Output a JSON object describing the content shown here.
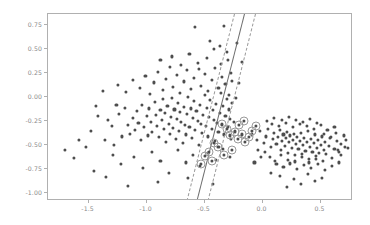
{
  "figure": {
    "background_color": "#ffffff",
    "axes_color": "#b0b0b0",
    "tick_label_color": "#8a8a8a"
  },
  "chart_data": {
    "type": "scatter",
    "title": "",
    "xlabel": "",
    "ylabel": "",
    "xlim": [
      -1.85,
      0.78
    ],
    "ylim": [
      -1.08,
      0.86
    ],
    "grid": false,
    "legend": null,
    "xticks": [
      -1.5,
      -1.0,
      -0.5,
      0.0,
      0.5
    ],
    "xticklabels": [
      "-1.5",
      "-1.0",
      "-0.5",
      "0.0",
      "0.5"
    ],
    "yticks": [
      0.75,
      0.5,
      0.25,
      0.0,
      -0.25,
      -0.5,
      -0.75,
      -1.0
    ],
    "yticklabels": [
      "0.75",
      "0.50",
      "0.25",
      "0.00",
      "-0.25",
      "-0.50",
      "-0.75",
      "-1.00"
    ],
    "point_color": "#4d4d4d",
    "point_size": 3.1,
    "support_vector_ring_color": "#9a9a9a",
    "decision_boundary": {
      "style": "solid",
      "color": "#6e6e6e",
      "x_at_ytop": -0.155,
      "x_at_ybottom": -0.565
    },
    "margins": [
      {
        "style": "dashed",
        "color": "#9a9a9a",
        "x_at_ytop": -0.235,
        "x_at_ybottom": -0.645
      },
      {
        "style": "dashed",
        "color": "#9a9a9a",
        "x_at_ytop": -0.055,
        "x_at_ybottom": -0.465
      }
    ],
    "series": [
      {
        "name": "class-0",
        "points": [
          [
            -1.38,
            0.06
          ],
          [
            -1.28,
            -0.5
          ],
          [
            -1.29,
            -0.6
          ],
          [
            -1.63,
            -0.63
          ],
          [
            -1.21,
            -0.41
          ],
          [
            -1.33,
            -0.24
          ],
          [
            -1.3,
            -0.3
          ],
          [
            -1.24,
            -0.18
          ],
          [
            -1.19,
            -0.11
          ],
          [
            -1.16,
            -0.29
          ],
          [
            -1.14,
            -0.38
          ],
          [
            -1.12,
            -0.22
          ],
          [
            -1.1,
            -0.34
          ],
          [
            -1.08,
            -0.15
          ],
          [
            -1.07,
            -0.27
          ],
          [
            -1.05,
            -0.45
          ],
          [
            -1.04,
            -0.08
          ],
          [
            -1.02,
            -0.31
          ],
          [
            -1.0,
            -0.2
          ],
          [
            -0.99,
            -0.4
          ],
          [
            -0.98,
            -0.12
          ],
          [
            -0.96,
            -0.26
          ],
          [
            -0.95,
            -0.36
          ],
          [
            -0.93,
            -0.05
          ],
          [
            -0.92,
            -0.19
          ],
          [
            -0.91,
            -0.3
          ],
          [
            -0.89,
            -0.42
          ],
          [
            -0.88,
            -0.14
          ],
          [
            -0.87,
            -0.24
          ],
          [
            -0.86,
            -0.02
          ],
          [
            -0.85,
            -0.33
          ],
          [
            -0.84,
            -0.17
          ],
          [
            -0.83,
            -0.47
          ],
          [
            -0.82,
            -0.09
          ],
          [
            -0.81,
            -0.28
          ],
          [
            -0.8,
            -0.38
          ],
          [
            -0.79,
            -0.21
          ],
          [
            -0.78,
            -0.01
          ],
          [
            -0.77,
            -0.32
          ],
          [
            -0.76,
            -0.13
          ],
          [
            -0.75,
            -0.44
          ],
          [
            -0.74,
            -0.23
          ],
          [
            -0.73,
            -0.06
          ],
          [
            -0.72,
            -0.35
          ],
          [
            -0.71,
            -0.16
          ],
          [
            -0.7,
            -0.26
          ],
          [
            -0.69,
            -0.48
          ],
          [
            -0.68,
            -0.1
          ],
          [
            -0.67,
            -0.29
          ],
          [
            -0.66,
            -0.39
          ],
          [
            -0.65,
            -0.18
          ],
          [
            -0.64,
            0.0
          ],
          [
            -0.63,
            -0.31
          ],
          [
            -0.62,
            -0.12
          ],
          [
            -0.61,
            -0.43
          ],
          [
            -0.6,
            -0.22
          ],
          [
            -0.59,
            -0.04
          ],
          [
            -0.58,
            -0.34
          ],
          [
            -0.57,
            -0.15
          ],
          [
            -0.56,
            -0.25
          ],
          [
            -0.55,
            -0.5
          ],
          [
            -0.54,
            -0.08
          ],
          [
            -0.53,
            -0.28
          ],
          [
            -0.52,
            -0.37
          ],
          [
            -0.51,
            -0.19
          ],
          [
            -0.5,
            0.02
          ],
          [
            -0.49,
            -0.3
          ],
          [
            -0.48,
            -0.11
          ],
          [
            -0.47,
            -0.41
          ],
          [
            -0.46,
            -0.21
          ],
          [
            -0.45,
            -0.03
          ],
          [
            -0.44,
            -0.33
          ],
          [
            -0.43,
            -0.14
          ],
          [
            -0.42,
            -0.24
          ],
          [
            -0.41,
            -0.46
          ],
          [
            -0.4,
            -0.07
          ],
          [
            -0.39,
            -0.27
          ],
          [
            -0.38,
            -0.36
          ],
          [
            -0.37,
            -0.17
          ],
          [
            -0.36,
            0.04
          ],
          [
            -0.35,
            -0.29
          ],
          [
            -0.34,
            -0.09
          ],
          [
            -0.33,
            -0.39
          ],
          [
            -0.32,
            -0.2
          ],
          [
            -0.31,
            -0.02
          ],
          [
            -0.3,
            -0.31
          ],
          [
            -0.29,
            -0.13
          ],
          [
            -0.28,
            -0.23
          ],
          [
            -0.27,
            -0.44
          ],
          [
            -0.26,
            -0.06
          ],
          [
            -0.25,
            -0.26
          ],
          [
            -0.24,
            -0.35
          ],
          [
            -1.25,
            0.12
          ],
          [
            -1.18,
            0.05
          ],
          [
            -1.12,
            0.18
          ],
          [
            -1.06,
            0.09
          ],
          [
            -1.01,
            0.22
          ],
          [
            -0.97,
            0.03
          ],
          [
            -0.94,
            0.15
          ],
          [
            -0.9,
            0.26
          ],
          [
            -0.86,
            0.07
          ],
          [
            -0.83,
            0.19
          ],
          [
            -0.8,
            0.31
          ],
          [
            -0.77,
            0.1
          ],
          [
            -0.74,
            0.23
          ],
          [
            -0.71,
            0.04
          ],
          [
            -0.68,
            0.16
          ],
          [
            -0.65,
            0.28
          ],
          [
            -0.62,
            0.08
          ],
          [
            -0.59,
            0.2
          ],
          [
            -0.56,
            0.35
          ],
          [
            -0.53,
            0.11
          ],
          [
            -0.5,
            0.24
          ],
          [
            -0.47,
            0.06
          ],
          [
            -0.44,
            0.18
          ],
          [
            -0.41,
            0.3
          ],
          [
            -0.38,
            0.09
          ],
          [
            -0.35,
            0.21
          ],
          [
            -0.32,
            0.13
          ],
          [
            -0.29,
            0.02
          ],
          [
            -0.88,
            0.38
          ],
          [
            -0.78,
            0.42
          ],
          [
            -0.7,
            0.33
          ],
          [
            -0.63,
            0.45
          ],
          [
            -0.55,
            0.29
          ],
          [
            -0.48,
            0.4
          ],
          [
            -0.42,
            0.5
          ],
          [
            -0.36,
            0.34
          ],
          [
            -0.31,
            0.47
          ],
          [
            -0.27,
            0.25
          ],
          [
            -0.58,
            0.73
          ],
          [
            -0.33,
            0.74
          ],
          [
            -0.45,
            0.58
          ],
          [
            -0.22,
            0.56
          ],
          [
            -0.18,
            0.36
          ],
          [
            -0.2,
            0.14
          ],
          [
            -0.23,
            -0.01
          ],
          [
            -0.26,
            0.17
          ],
          [
            -0.3,
            0.38
          ],
          [
            -0.37,
            0.53
          ],
          [
            -1.45,
            -0.77
          ],
          [
            -1.35,
            -0.83
          ],
          [
            -1.22,
            -0.7
          ],
          [
            -1.11,
            -0.62
          ],
          [
            -1.03,
            -0.74
          ],
          [
            -0.95,
            -0.57
          ],
          [
            -0.88,
            -0.66
          ],
          [
            -0.81,
            -0.79
          ],
          [
            -0.73,
            -0.55
          ],
          [
            -0.66,
            -0.68
          ],
          [
            -0.6,
            -0.6
          ],
          [
            -0.54,
            -0.72
          ],
          [
            -0.47,
            -0.58
          ],
          [
            -0.4,
            -0.65
          ],
          [
            -0.34,
            -0.54
          ],
          [
            -0.28,
            -0.62
          ],
          [
            -1.16,
            -0.92
          ],
          [
            -0.9,
            -0.88
          ],
          [
            -0.64,
            -0.84
          ],
          [
            -0.43,
            -0.9
          ],
          [
            -1.48,
            -0.35
          ],
          [
            -1.52,
            -0.52
          ],
          [
            -1.42,
            -0.2
          ],
          [
            -1.58,
            -0.45
          ],
          [
            -1.7,
            -0.55
          ],
          [
            -1.44,
            -0.09
          ],
          [
            -1.36,
            -0.45
          ],
          [
            -1.26,
            -0.08
          ]
        ]
      },
      {
        "name": "class-1",
        "points": [
          [
            -0.09,
            -0.39
          ],
          [
            -0.05,
            -0.45
          ],
          [
            -0.02,
            -0.35
          ],
          [
            0.01,
            -0.48
          ],
          [
            0.03,
            -0.41
          ],
          [
            0.05,
            -0.33
          ],
          [
            0.07,
            -0.52
          ],
          [
            0.09,
            -0.44
          ],
          [
            0.1,
            -0.37
          ],
          [
            0.12,
            -0.49
          ],
          [
            0.13,
            -0.42
          ],
          [
            0.15,
            -0.34
          ],
          [
            0.16,
            -0.55
          ],
          [
            0.17,
            -0.46
          ],
          [
            0.18,
            -0.39
          ],
          [
            0.19,
            -0.51
          ],
          [
            0.2,
            -0.43
          ],
          [
            0.21,
            -0.36
          ],
          [
            0.22,
            -0.58
          ],
          [
            0.23,
            -0.47
          ],
          [
            0.24,
            -0.4
          ],
          [
            0.25,
            -0.53
          ],
          [
            0.26,
            -0.45
          ],
          [
            0.27,
            -0.38
          ],
          [
            0.28,
            -0.6
          ],
          [
            0.29,
            -0.49
          ],
          [
            0.3,
            -0.42
          ],
          [
            0.31,
            -0.54
          ],
          [
            0.32,
            -0.46
          ],
          [
            0.33,
            -0.37
          ],
          [
            0.34,
            -0.62
          ],
          [
            0.35,
            -0.5
          ],
          [
            0.36,
            -0.43
          ],
          [
            0.37,
            -0.56
          ],
          [
            0.38,
            -0.47
          ],
          [
            0.39,
            -0.35
          ],
          [
            0.4,
            -0.64
          ],
          [
            0.41,
            -0.52
          ],
          [
            0.42,
            -0.44
          ],
          [
            0.43,
            -0.57
          ],
          [
            0.44,
            -0.48
          ],
          [
            0.45,
            -0.39
          ],
          [
            0.46,
            -0.61
          ],
          [
            0.47,
            -0.53
          ],
          [
            0.48,
            -0.45
          ],
          [
            0.49,
            -0.58
          ],
          [
            0.5,
            -0.5
          ],
          [
            0.51,
            -0.41
          ],
          [
            0.52,
            -0.66
          ],
          [
            0.53,
            -0.55
          ],
          [
            0.54,
            -0.47
          ],
          [
            0.55,
            -0.59
          ],
          [
            0.57,
            -0.51
          ],
          [
            0.58,
            -0.43
          ],
          [
            0.6,
            -0.63
          ],
          [
            0.62,
            -0.54
          ],
          [
            0.64,
            -0.46
          ],
          [
            0.66,
            -0.57
          ],
          [
            0.68,
            -0.49
          ],
          [
            0.7,
            -0.4
          ],
          [
            0.08,
            -0.28
          ],
          [
            0.14,
            -0.3
          ],
          [
            0.2,
            -0.27
          ],
          [
            0.26,
            -0.31
          ],
          [
            0.32,
            -0.28
          ],
          [
            0.38,
            -0.3
          ],
          [
            0.44,
            -0.33
          ],
          [
            0.5,
            -0.29
          ],
          [
            0.56,
            -0.34
          ],
          [
            0.62,
            -0.31
          ],
          [
            0.12,
            -0.7
          ],
          [
            0.18,
            -0.73
          ],
          [
            0.24,
            -0.69
          ],
          [
            0.3,
            -0.75
          ],
          [
            0.36,
            -0.71
          ],
          [
            0.42,
            -0.74
          ],
          [
            0.48,
            -0.7
          ],
          [
            0.54,
            -0.76
          ],
          [
            0.6,
            -0.72
          ],
          [
            0.66,
            -0.68
          ],
          [
            0.06,
            -0.62
          ],
          [
            0.11,
            -0.66
          ],
          [
            0.16,
            -0.6
          ],
          [
            0.22,
            -0.65
          ],
          [
            0.28,
            -0.67
          ],
          [
            0.34,
            -0.59
          ],
          [
            0.4,
            -0.68
          ],
          [
            0.46,
            -0.64
          ],
          [
            0.02,
            -0.57
          ],
          [
            -0.01,
            -0.62
          ],
          [
            -0.04,
            -0.55
          ],
          [
            -0.07,
            -0.68
          ],
          [
            0.04,
            -0.25
          ],
          [
            0.1,
            -0.22
          ],
          [
            0.17,
            -0.24
          ],
          [
            0.23,
            -0.21
          ],
          [
            0.29,
            -0.24
          ],
          [
            0.35,
            -0.26
          ],
          [
            0.41,
            -0.23
          ],
          [
            0.47,
            -0.27
          ],
          [
            0.53,
            -0.38
          ],
          [
            0.59,
            -0.42
          ],
          [
            0.65,
            -0.55
          ],
          [
            0.71,
            -0.52
          ],
          [
            0.15,
            -0.82
          ],
          [
            0.27,
            -0.85
          ],
          [
            0.39,
            -0.8
          ],
          [
            0.51,
            -0.84
          ],
          [
            0.07,
            -0.79
          ],
          [
            0.45,
            -0.87
          ],
          [
            0.33,
            -0.9
          ],
          [
            0.21,
            -0.93
          ],
          [
            0.68,
            -0.6
          ],
          [
            0.72,
            -0.45
          ],
          [
            0.74,
            -0.53
          ],
          [
            0.63,
            -0.37
          ]
        ]
      }
    ],
    "support_vectors": [
      [
        -0.31,
        -0.33
      ],
      [
        -0.28,
        -0.4
      ],
      [
        -0.24,
        -0.36
      ],
      [
        -0.21,
        -0.44
      ],
      [
        -0.18,
        -0.39
      ],
      [
        -0.15,
        -0.47
      ],
      [
        -0.12,
        -0.42
      ],
      [
        -0.35,
        -0.28
      ],
      [
        -0.38,
        -0.52
      ],
      [
        -0.42,
        -0.48
      ],
      [
        -0.46,
        -0.57
      ],
      [
        -0.5,
        -0.61
      ],
      [
        -0.26,
        -0.55
      ],
      [
        -0.33,
        -0.6
      ],
      [
        -0.09,
        -0.35
      ],
      [
        -0.06,
        -0.3
      ],
      [
        -0.2,
        -0.29
      ],
      [
        -0.16,
        -0.25
      ],
      [
        -0.44,
        -0.66
      ],
      [
        -0.53,
        -0.7
      ]
    ]
  }
}
